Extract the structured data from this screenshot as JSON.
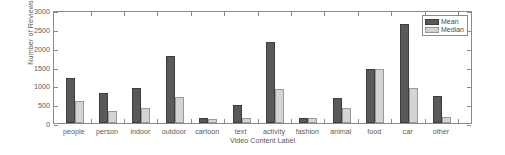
{
  "chart_data": {
    "type": "bar",
    "title": "",
    "xlabel": "Video Content Label",
    "ylabel": "Number of Reviews",
    "ylim": [
      0,
      3000
    ],
    "yticks": [
      0,
      500,
      1000,
      1500,
      2000,
      2500,
      3000
    ],
    "ytick_labels": [
      "0",
      "500",
      "1000",
      "1500",
      "2000",
      "2500",
      "3000"
    ],
    "grid": false,
    "legend_position": "top-right",
    "categories": [
      "people",
      "person",
      "indoor",
      "outdoor",
      "cartoon",
      "text",
      "activity",
      "fashion",
      "animal",
      "food",
      "car",
      "other"
    ],
    "series": [
      {
        "name": "Mean",
        "color": "#595959",
        "values": [
          1190,
          800,
          920,
          1780,
          130,
          490,
          2160,
          140,
          670,
          1440,
          2640,
          720
        ]
      },
      {
        "name": "Median",
        "color": "#d4d4d4",
        "values": [
          580,
          320,
          410,
          680,
          100,
          130,
          890,
          135,
          390,
          1440,
          920,
          150
        ]
      }
    ]
  },
  "legend": {
    "items": [
      {
        "label": "Mean",
        "key": "mean"
      },
      {
        "label": "Median",
        "key": "median"
      }
    ]
  },
  "colors": {
    "mean": "#595959",
    "median": "#d4d4d4",
    "axis": "#8a8a8a",
    "text": "#5b5b5b",
    "background": "#ffffff"
  }
}
